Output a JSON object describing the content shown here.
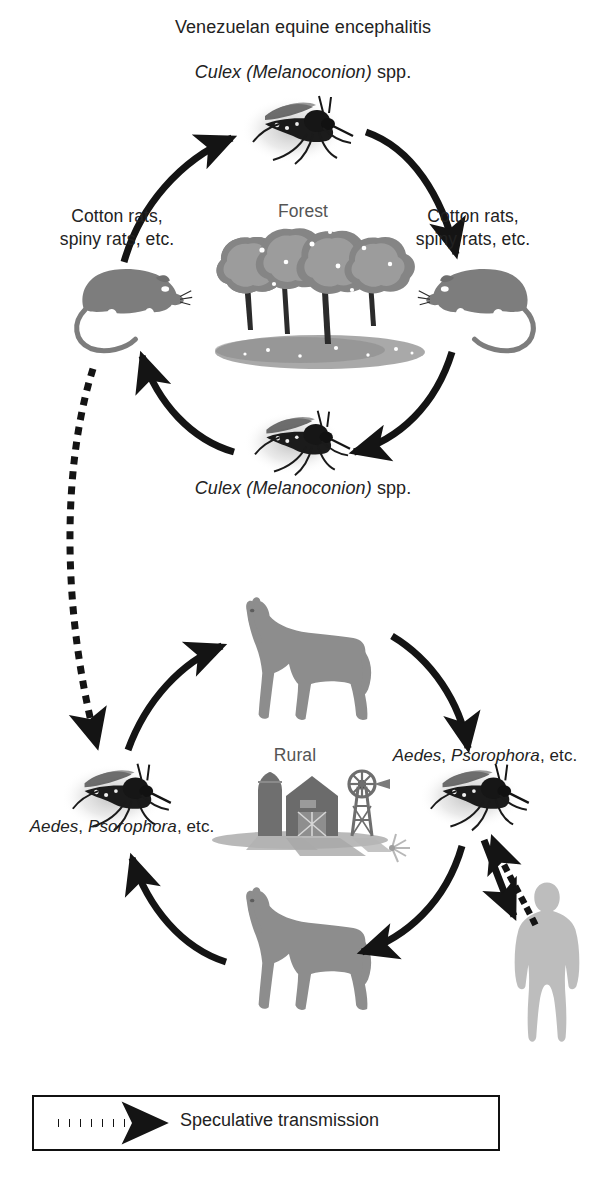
{
  "figure": {
    "title": "Venezuelan equine encephalitis",
    "background_color": "#ffffff",
    "arrow_color": "#141414",
    "animal_fill": "#7d7d7d",
    "human_fill": "#b9b9b9",
    "mosquito_fill": "#1b1b1b"
  },
  "enzootic_cycle": {
    "vector_label_top": "Culex (Melanoconion) spp.",
    "vector_label_bottom": "Culex (Melanoconion) spp.",
    "vector_genus": "Culex (Melanoconion)",
    "vector_suffix": "spp.",
    "host_label_left": "Cotton rats,\nspiny rats, etc.",
    "host_label_right": "Cotton rats,\nspiny rats, etc.",
    "habitat_label": "Forest"
  },
  "epizootic_cycle": {
    "habitat_label": "Rural",
    "vector_label_right": "Aedes, Psorophora, etc.",
    "vector_label_left": "Aedes, Psorophora, etc.",
    "vector_genus_one": "Aedes",
    "vector_genus_two": "Psorophora",
    "vector_suffix": ", etc.",
    "vector_separator": ", "
  },
  "legend": {
    "speculative_label": "Speculative transmission",
    "line_style": "dotted",
    "arrow_head": "filled-triangle"
  },
  "icons": {
    "mosquito": "mosquito-icon",
    "rat": "rat-icon",
    "horse": "horse-icon",
    "human": "human-icon",
    "tree": "tree-icon",
    "barn": "barn-icon",
    "silo": "silo-icon",
    "windmill": "windmill-icon"
  }
}
